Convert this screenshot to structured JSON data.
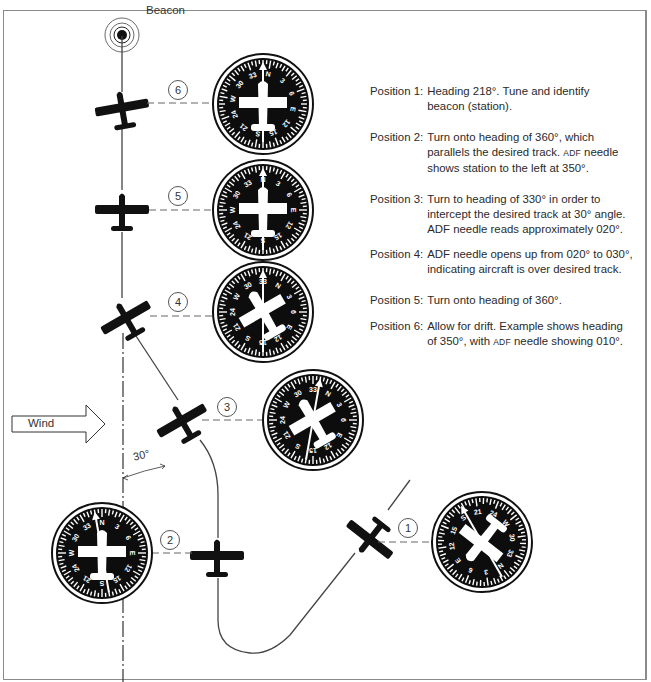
{
  "figure": {
    "beacon_label": "Beacon",
    "wind_label": "Wind",
    "angle_label": "30°",
    "positions": [
      {
        "num": "1",
        "heading": 218,
        "adf_needle": 350
      },
      {
        "num": "2",
        "heading": 360,
        "adf_needle": 350
      },
      {
        "num": "3",
        "heading": 330,
        "adf_needle": 20
      },
      {
        "num": "4",
        "heading": 330,
        "adf_needle": 30
      },
      {
        "num": "5",
        "heading": 360,
        "adf_needle": 0
      },
      {
        "num": "6",
        "heading": 350,
        "adf_needle": 10
      }
    ],
    "compass_card_labels": [
      "N",
      "3",
      "6",
      "E",
      "12",
      "15",
      "S",
      "21",
      "24",
      "W",
      "30",
      "33"
    ]
  },
  "descriptions": [
    {
      "label": "Position 1:",
      "line1": "Heading 218°. Tune and identify",
      "line2": "beacon (station)."
    },
    {
      "label": "Position 2:",
      "line1": "Turn onto heading of 360°, which",
      "line2a": "parallels the desired track. ",
      "line2_sc": "ADF",
      "line2b": " needle",
      "line3": "shows station to the left at 350°."
    },
    {
      "label": "Position 3:",
      "line1": "Turn to heading of 330° in order to",
      "line2": "intercept the desired track at 30° angle.",
      "line3": "ADF needle reads approximately 020°."
    },
    {
      "label": "Position 4:",
      "line1": "ADF needle opens up from 020° to 030°,",
      "line2": "indicating aircraft is over desired track."
    },
    {
      "label": "Position 5:",
      "line1": "Turn onto heading of 360°."
    },
    {
      "label": "Position 6:",
      "line1": "Allow for drift. Example shows heading",
      "line2a": "of 350°, with ",
      "line2_sc": "ADF",
      "line2b": " needle showing 010°."
    }
  ],
  "colors": {
    "ink": "#111111",
    "line": "#444444",
    "frame": "#8a8a8a",
    "dial": "#0d0d0d",
    "dial_marks": "#ffffff"
  }
}
